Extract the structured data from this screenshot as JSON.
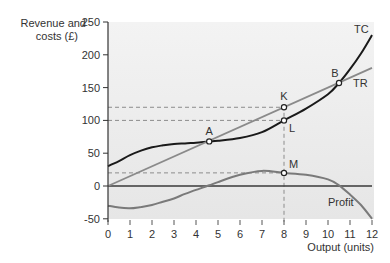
{
  "chart_data": {
    "type": "line",
    "title": "",
    "xlabel": "Output (units)",
    "ylabel": "Revenue and costs (£)",
    "ylabel_lines": [
      "Revenue and",
      "costs (£)"
    ],
    "xlim": [
      0,
      12
    ],
    "ylim": [
      -50,
      250
    ],
    "x_ticks": [
      0,
      1,
      2,
      3,
      4,
      5,
      6,
      7,
      8,
      9,
      10,
      11,
      12
    ],
    "y_ticks": [
      -50,
      0,
      50,
      100,
      150,
      200,
      250
    ],
    "grid": false,
    "legend": "inline labels",
    "series": [
      {
        "name": "TC",
        "label": "TC",
        "color": "#1a1a1a",
        "x": [
          0,
          0.5,
          1,
          1.5,
          2,
          2.5,
          3,
          3.5,
          4,
          4.6,
          5,
          6,
          7,
          8,
          9,
          10,
          10.5,
          11,
          11.5,
          12
        ],
        "y": [
          30,
          38,
          47,
          54,
          59,
          62,
          64,
          65,
          66,
          68,
          69,
          73,
          82,
          100,
          118,
          140,
          157,
          178,
          202,
          230
        ]
      },
      {
        "name": "TR",
        "label": "TR",
        "color": "#8a8a8a",
        "x": [
          0,
          12
        ],
        "y": [
          0,
          180
        ]
      },
      {
        "name": "Profit",
        "label": "Profit",
        "color": "#7a7a7a",
        "x": [
          0,
          0.5,
          1,
          1.5,
          2,
          2.5,
          3,
          3.5,
          4,
          4.6,
          5,
          6,
          7,
          8,
          9,
          10,
          10.5,
          11,
          11.5,
          12
        ],
        "y": [
          -30,
          -33,
          -34,
          -32,
          -29,
          -24,
          -19,
          -12,
          -6,
          1,
          6,
          17,
          23,
          20,
          17,
          10,
          1,
          -13,
          -29,
          -50
        ]
      }
    ],
    "points": [
      {
        "label": "A",
        "x": 4.6,
        "y": 68
      },
      {
        "label": "B",
        "x": 10.5,
        "y": 157
      },
      {
        "label": "K",
        "x": 8,
        "y": 120
      },
      {
        "label": "L",
        "x": 8,
        "y": 100
      },
      {
        "label": "M",
        "x": 8,
        "y": 20
      }
    ],
    "reference_lines": [
      {
        "type": "horizontal",
        "y": 120,
        "x_to": 8,
        "style": "dashed"
      },
      {
        "type": "horizontal",
        "y": 100,
        "x_to": 8,
        "style": "dashed"
      },
      {
        "type": "horizontal",
        "y": 20,
        "x_to": 8,
        "style": "dashed"
      },
      {
        "type": "vertical",
        "x": 8,
        "y_from": -50,
        "y_to": 120,
        "style": "dashed"
      },
      {
        "type": "horizontal",
        "y": 0,
        "style": "solid"
      }
    ],
    "plot_background": "#ebebeb"
  }
}
